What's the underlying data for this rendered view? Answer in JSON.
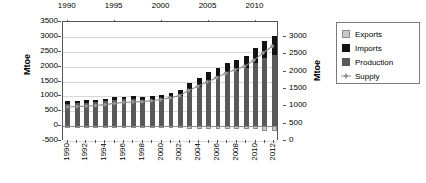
{
  "chart_data": {
    "type": "bar",
    "title": "",
    "subtitle": "",
    "xlabel": "",
    "ylabel": "Mtoe",
    "ylabel_right": "Mtoe",
    "ylim": [
      -500,
      3500
    ],
    "ylim_right": [
      0,
      3000
    ],
    "yticks": [
      3500,
      3000,
      2500,
      2000,
      1500,
      1000,
      500,
      0,
      -500
    ],
    "yticks_right": [
      3000,
      2500,
      2000,
      1500,
      1000,
      500,
      0
    ],
    "xticks_top": [
      1990,
      1995,
      2000,
      2005,
      2010
    ],
    "grid": true,
    "legend_position": "right-outside",
    "stacked": true,
    "categories": [
      "1990",
      "1991",
      "1992",
      "1993",
      "1994",
      "1995",
      "1996",
      "1997",
      "1998",
      "1999",
      "2000",
      "2001",
      "2002",
      "2003",
      "2004",
      "2005",
      "2006",
      "2007",
      "2008",
      "2009",
      "2010",
      "2011",
      "2012"
    ],
    "xtick_labels": [
      "1990",
      "1992",
      "1994",
      "1996",
      "1998",
      "2000",
      "2002",
      "2004",
      "2006",
      "2008",
      "2010",
      "2012"
    ],
    "series": [
      {
        "name": "Production",
        "color": "#595959",
        "values": [
          760,
          775,
          790,
          800,
          830,
          875,
          900,
          900,
          880,
          880,
          900,
          950,
          1010,
          1190,
          1320,
          1520,
          1640,
          1770,
          1860,
          1940,
          2130,
          2300,
          2390
        ]
      },
      {
        "name": "Imports",
        "color": "#121212",
        "values": [
          70,
          70,
          75,
          80,
          85,
          90,
          95,
          110,
          115,
          140,
          160,
          170,
          200,
          250,
          290,
          300,
          330,
          350,
          370,
          420,
          490,
          560,
          630
        ]
      },
      {
        "name": "Exports",
        "color": "#c9c9c9",
        "values": [
          -40,
          -40,
          -45,
          -50,
          -50,
          -55,
          -60,
          -65,
          -60,
          -60,
          -65,
          -70,
          -75,
          -80,
          -90,
          -100,
          -95,
          -95,
          -90,
          -95,
          -110,
          -160,
          -165
        ]
      },
      {
        "name": "Supply",
        "color": "#8c8c8c",
        "marker": "diamond",
        "values": [
          620,
          635,
          650,
          670,
          700,
          740,
          770,
          790,
          800,
          830,
          870,
          930,
          1000,
          1180,
          1320,
          1470,
          1610,
          1760,
          1880,
          1990,
          2200,
          2450,
          2680
        ]
      }
    ]
  },
  "legend": {
    "items": [
      {
        "label": "Exports",
        "swatch": "exports"
      },
      {
        "label": "Imports",
        "swatch": "imports"
      },
      {
        "label": "Production",
        "swatch": "production"
      },
      {
        "label": "Supply",
        "swatch": "supply"
      }
    ]
  }
}
